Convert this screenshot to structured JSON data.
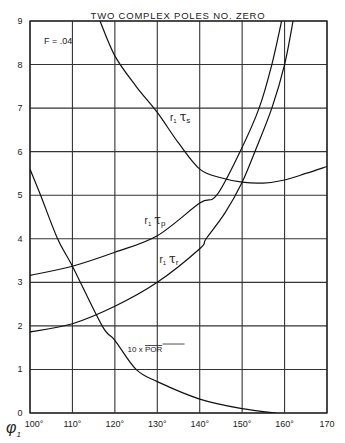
{
  "chart_data": {
    "type": "line",
    "title": "TWO COMPLEX POLES NO. ZERO",
    "annotation": "F = .04",
    "xlabel": "φ1",
    "ylabel": "",
    "xlim": [
      100,
      170
    ],
    "ylim": [
      0,
      9
    ],
    "grid": true,
    "x_ticks": [
      100,
      110,
      120,
      130,
      140,
      150,
      160,
      170
    ],
    "x_tick_labels": [
      "100°",
      "110°",
      "120°",
      "130°",
      "140°",
      "150°",
      "160°",
      "170"
    ],
    "y_ticks": [
      0,
      1,
      2,
      3,
      4,
      5,
      6,
      7,
      8,
      9
    ],
    "y_tick_labels": [
      "0",
      "1",
      "2",
      "3",
      "4",
      "5",
      "6",
      "7",
      "8",
      "9"
    ],
    "series": [
      {
        "name": "r1 τs",
        "label_parts": [
          "r",
          "1",
          "τ",
          "s"
        ],
        "x": [
          116.5,
          120,
          125,
          130,
          135,
          140,
          145,
          150,
          155,
          160,
          165,
          170
        ],
        "y": [
          9.0,
          8.2,
          7.5,
          6.9,
          6.2,
          5.6,
          5.4,
          5.3,
          5.28,
          5.35,
          5.5,
          5.66
        ],
        "label_pos": [
          133,
          6.7
        ]
      },
      {
        "name": "r1 τp",
        "label_parts": [
          "r",
          "1",
          "τ",
          "p"
        ],
        "x": [
          100,
          110,
          120,
          130,
          140,
          144,
          149.5,
          154,
          157,
          159.3
        ],
        "y": [
          3.16,
          3.37,
          3.69,
          4.07,
          4.82,
          5.0,
          6.0,
          7.0,
          8.0,
          9.0
        ],
        "label_pos": [
          127,
          4.35
        ]
      },
      {
        "name": "r1 τr",
        "label_parts": [
          "r",
          "1",
          "τ",
          "r"
        ],
        "x": [
          100,
          110,
          120,
          130,
          140,
          141.5,
          146,
          150,
          153,
          157,
          160,
          162
        ],
        "y": [
          1.86,
          2.05,
          2.45,
          3.0,
          3.77,
          4.0,
          4.6,
          5.3,
          6.0,
          7.0,
          8.0,
          9.0
        ],
        "label_pos": [
          130.5,
          3.45
        ]
      },
      {
        "name": "10 x POR",
        "label_parts": [
          "10 x ",
          "POR"
        ],
        "x": [
          100,
          102.5,
          106.5,
          110,
          117,
          120,
          125,
          130,
          140,
          150,
          158
        ],
        "y": [
          5.6,
          5.0,
          4.0,
          3.37,
          2.0,
          1.67,
          1.0,
          0.72,
          0.32,
          0.1,
          0.0
        ],
        "label_pos": [
          123,
          1.4
        ]
      }
    ]
  }
}
